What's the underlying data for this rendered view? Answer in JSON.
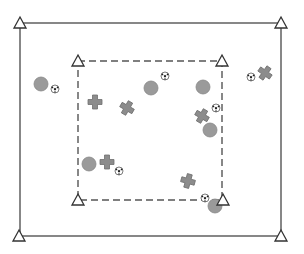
{
  "diagram": {
    "type": "soccer-drill-field",
    "colors": {
      "background": "#ffffff",
      "outer_line": "#555555",
      "inner_line": "#555555",
      "cone_stroke": "#333333",
      "cone_fill": "#ffffff",
      "player_circle": "#9a9a9a",
      "player_circle_edge": "#888888",
      "player_cross": "#8c8c8c",
      "player_cross_edge": "#6f6f6f",
      "ball_fill": "#ffffff",
      "ball_patch": "#222222"
    },
    "outer_field": {
      "x1": 20,
      "y1": 23,
      "x2": 281,
      "y2": 236
    },
    "inner_area": {
      "x1": 78,
      "y1": 61,
      "x2": 222,
      "y2": 200,
      "dashed": true
    },
    "cones": [
      {
        "id": "outer-top-left",
        "x": 20,
        "y": 23
      },
      {
        "id": "outer-top-right",
        "x": 281,
        "y": 23
      },
      {
        "id": "outer-bottom-left",
        "x": 19,
        "y": 236
      },
      {
        "id": "outer-bottom-right",
        "x": 281,
        "y": 236
      },
      {
        "id": "inner-top-left",
        "x": 78,
        "y": 61
      },
      {
        "id": "inner-top-right",
        "x": 222,
        "y": 61
      },
      {
        "id": "inner-bottom-left",
        "x": 78,
        "y": 200
      },
      {
        "id": "inner-bottom-right",
        "x": 223,
        "y": 200
      }
    ],
    "circle_players": [
      {
        "x": 41,
        "y": 84,
        "r": 7
      },
      {
        "x": 151,
        "y": 88,
        "r": 7
      },
      {
        "x": 203,
        "y": 87,
        "r": 7
      },
      {
        "x": 210,
        "y": 130,
        "r": 7
      },
      {
        "x": 89,
        "y": 164,
        "r": 7
      },
      {
        "x": 215,
        "y": 206,
        "r": 7
      }
    ],
    "cross_players": [
      {
        "x": 95,
        "y": 102,
        "rot": 0
      },
      {
        "x": 127,
        "y": 108,
        "rot": 30
      },
      {
        "x": 202,
        "y": 116,
        "rot": 30
      },
      {
        "x": 265,
        "y": 73,
        "rot": 35
      },
      {
        "x": 107,
        "y": 162,
        "rot": 0
      },
      {
        "x": 188,
        "y": 181,
        "rot": 15
      }
    ],
    "balls": [
      {
        "x": 55,
        "y": 89,
        "r": 4
      },
      {
        "x": 165,
        "y": 76,
        "r": 4
      },
      {
        "x": 216,
        "y": 108,
        "r": 4
      },
      {
        "x": 251,
        "y": 77,
        "r": 4
      },
      {
        "x": 119,
        "y": 171,
        "r": 4
      },
      {
        "x": 205,
        "y": 198,
        "r": 4
      }
    ]
  }
}
